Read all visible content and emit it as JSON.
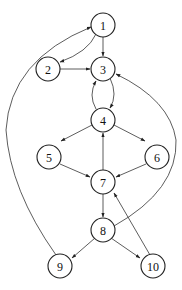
{
  "diagram": {
    "type": "directed-graph",
    "nodes": [
      {
        "id": "1",
        "label": "1",
        "x": 103,
        "y": 25
      },
      {
        "id": "2",
        "label": "2",
        "x": 48,
        "y": 69
      },
      {
        "id": "3",
        "label": "3",
        "x": 103,
        "y": 69
      },
      {
        "id": "4",
        "label": "4",
        "x": 103,
        "y": 120
      },
      {
        "id": "5",
        "label": "5",
        "x": 49,
        "y": 157
      },
      {
        "id": "6",
        "label": "6",
        "x": 157,
        "y": 157
      },
      {
        "id": "7",
        "label": "7",
        "x": 103,
        "y": 182
      },
      {
        "id": "8",
        "label": "8",
        "x": 103,
        "y": 230
      },
      {
        "id": "9",
        "label": "9",
        "x": 60,
        "y": 266
      },
      {
        "id": "10",
        "label": "10",
        "x": 153,
        "y": 266
      }
    ],
    "edges": [
      {
        "from": "1",
        "to": "2",
        "path": "M96,34 Q88,52 60,62"
      },
      {
        "from": "1",
        "to": "3",
        "path": "M103,36 L103,56"
      },
      {
        "from": "2",
        "to": "3",
        "path": "M60,69 L90,69"
      },
      {
        "from": "3",
        "to": "4",
        "path": "M110,78 Q118,95 110,108"
      },
      {
        "from": "4",
        "to": "3",
        "path": "M96,109 Q88,95 96,81"
      },
      {
        "from": "4",
        "to": "5",
        "path": "M92,125 L61,141"
      },
      {
        "from": "4",
        "to": "6",
        "path": "M114,125 L145,141"
      },
      {
        "from": "5",
        "to": "7",
        "path": "M60,164 L90,177"
      },
      {
        "from": "6",
        "to": "7",
        "path": "M146,164 L116,177"
      },
      {
        "from": "7",
        "to": "4",
        "path": "M103,170 L103,133"
      },
      {
        "from": "7",
        "to": "8",
        "path": "M103,194 L103,217"
      },
      {
        "from": "8",
        "to": "9",
        "path": "M95,238 L72,258"
      },
      {
        "from": "8",
        "to": "10",
        "path": "M111,238 L140,258"
      },
      {
        "from": "10",
        "to": "7",
        "path": "M150,255 L114,193"
      },
      {
        "from": "8",
        "to": "3",
        "path": "M114,226 Q178,190 176,140 Q170,100 116,74"
      },
      {
        "from": "9",
        "to": "1",
        "path": "M56,255 Q10,190 6,130 Q10,60 91,27"
      }
    ]
  }
}
